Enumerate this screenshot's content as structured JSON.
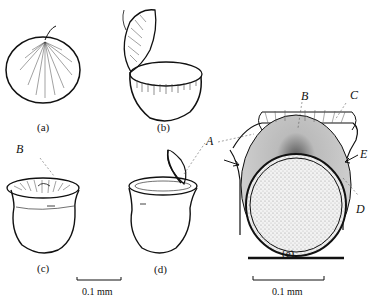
{
  "figure": {
    "panels": [
      {
        "id": "a",
        "caption": "(a)"
      },
      {
        "id": "b",
        "caption": "(b)"
      },
      {
        "id": "c",
        "caption": "(c)"
      },
      {
        "id": "d",
        "caption": "(d)"
      },
      {
        "id": "e",
        "caption": "(e)"
      }
    ],
    "labels": {
      "A": "A",
      "B_c": "B",
      "B_e": "B",
      "C": "C",
      "D": "D",
      "E": "E"
    },
    "scale_bars": [
      {
        "label": "0.1 mm",
        "position": "under panels c-d"
      },
      {
        "label": "0.1 mm",
        "position": "under panel e"
      }
    ]
  }
}
